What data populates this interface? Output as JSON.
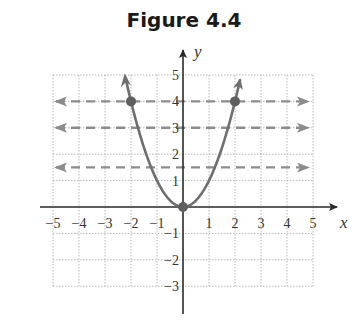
{
  "title": "Figure 4.4",
  "colors": {
    "axis": "#2a2a2a",
    "grid": "#b8b8b8",
    "curve": "#6e6e6e",
    "dashed": "#8c8c8c",
    "point": "#5e5e5e"
  },
  "chart_data": {
    "type": "line",
    "title": "Figure 4.4",
    "xlabel": "x",
    "ylabel": "y",
    "xlim": [
      -5,
      5
    ],
    "ylim": [
      -3,
      5
    ],
    "grid": true,
    "x_ticks": [
      "-5",
      "-4",
      "-3",
      "-2",
      "-1",
      "1",
      "2",
      "3",
      "4",
      "5"
    ],
    "y_ticks": [
      "5",
      "4",
      "3",
      "2",
      "1",
      "-1",
      "-2",
      "-3"
    ],
    "series": [
      {
        "name": "y = x^2",
        "style": "solid curve with arrows at ends",
        "x": [
          -2,
          -1.5,
          -1,
          -0.5,
          0,
          0.5,
          1,
          1.5,
          2
        ],
        "y": [
          4,
          2.25,
          1,
          0.25,
          0,
          0.25,
          1,
          2.25,
          4
        ]
      },
      {
        "name": "horizontal line y = 4",
        "style": "dashed, arrows both ends",
        "y": 4
      },
      {
        "name": "horizontal line y = 3",
        "style": "dashed, arrows both ends",
        "y": 3
      },
      {
        "name": "horizontal line y = 1.5",
        "style": "dashed, arrows both ends",
        "y": 1.5
      }
    ],
    "points": [
      {
        "x": -2,
        "y": 4
      },
      {
        "x": 0,
        "y": 0
      },
      {
        "x": 2,
        "y": 4
      }
    ]
  }
}
